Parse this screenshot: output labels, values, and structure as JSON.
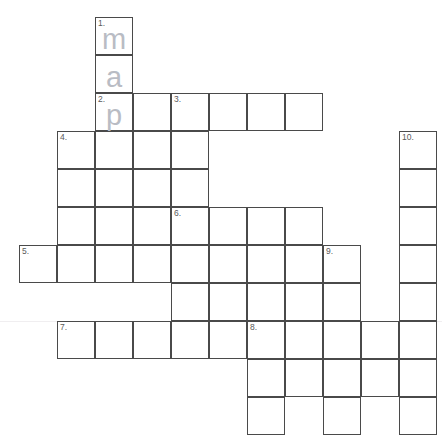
{
  "puzzle": {
    "title": "crossword-grid",
    "cell_size": 38,
    "origin_x": 19,
    "origin_y": 17,
    "border_color": "#4a4a4a",
    "cell_background": "#ffffff",
    "number_color": "#5a5a5a",
    "letter_color": "#b9bcc4",
    "page_background": "#ffffff",
    "rule_color": "#f0eef0",
    "rules_y": [
      321
    ],
    "cells": [
      {
        "col": 2,
        "row": 0,
        "number": "1.",
        "letter": "m"
      },
      {
        "col": 2,
        "row": 1,
        "number": "",
        "letter": "a"
      },
      {
        "col": 2,
        "row": 2,
        "number": "2.",
        "letter": "p"
      },
      {
        "col": 3,
        "row": 2,
        "number": "",
        "letter": ""
      },
      {
        "col": 4,
        "row": 2,
        "number": "3.",
        "letter": ""
      },
      {
        "col": 5,
        "row": 2,
        "number": "",
        "letter": ""
      },
      {
        "col": 6,
        "row": 2,
        "number": "",
        "letter": ""
      },
      {
        "col": 7,
        "row": 2,
        "number": "",
        "letter": ""
      },
      {
        "col": 1,
        "row": 3,
        "number": "4.",
        "letter": ""
      },
      {
        "col": 2,
        "row": 3,
        "number": "",
        "letter": ""
      },
      {
        "col": 3,
        "row": 3,
        "number": "",
        "letter": ""
      },
      {
        "col": 4,
        "row": 3,
        "number": "",
        "letter": ""
      },
      {
        "col": 1,
        "row": 4,
        "number": "",
        "letter": ""
      },
      {
        "col": 2,
        "row": 4,
        "number": "",
        "letter": ""
      },
      {
        "col": 3,
        "row": 4,
        "number": "",
        "letter": ""
      },
      {
        "col": 4,
        "row": 4,
        "number": "",
        "letter": ""
      },
      {
        "col": 1,
        "row": 5,
        "number": "",
        "letter": ""
      },
      {
        "col": 2,
        "row": 5,
        "number": "",
        "letter": ""
      },
      {
        "col": 3,
        "row": 5,
        "number": "",
        "letter": ""
      },
      {
        "col": 4,
        "row": 5,
        "number": "6.",
        "letter": ""
      },
      {
        "col": 5,
        "row": 5,
        "number": "",
        "letter": ""
      },
      {
        "col": 6,
        "row": 5,
        "number": "",
        "letter": ""
      },
      {
        "col": 7,
        "row": 5,
        "number": "",
        "letter": ""
      },
      {
        "col": 0,
        "row": 6,
        "number": "5.",
        "letter": ""
      },
      {
        "col": 1,
        "row": 6,
        "number": "",
        "letter": ""
      },
      {
        "col": 2,
        "row": 6,
        "number": "",
        "letter": ""
      },
      {
        "col": 3,
        "row": 6,
        "number": "",
        "letter": ""
      },
      {
        "col": 4,
        "row": 6,
        "number": "",
        "letter": ""
      },
      {
        "col": 5,
        "row": 6,
        "number": "",
        "letter": ""
      },
      {
        "col": 6,
        "row": 6,
        "number": "",
        "letter": ""
      },
      {
        "col": 7,
        "row": 6,
        "number": "",
        "letter": ""
      },
      {
        "col": 8,
        "row": 6,
        "number": "9.",
        "letter": ""
      },
      {
        "col": 4,
        "row": 7,
        "number": "",
        "letter": ""
      },
      {
        "col": 5,
        "row": 7,
        "number": "",
        "letter": ""
      },
      {
        "col": 6,
        "row": 7,
        "number": "",
        "letter": ""
      },
      {
        "col": 7,
        "row": 7,
        "number": "",
        "letter": ""
      },
      {
        "col": 8,
        "row": 7,
        "number": "",
        "letter": ""
      },
      {
        "col": 1,
        "row": 8,
        "number": "7.",
        "letter": ""
      },
      {
        "col": 2,
        "row": 8,
        "number": "",
        "letter": ""
      },
      {
        "col": 3,
        "row": 8,
        "number": "",
        "letter": ""
      },
      {
        "col": 4,
        "row": 8,
        "number": "",
        "letter": ""
      },
      {
        "col": 5,
        "row": 8,
        "number": "",
        "letter": ""
      },
      {
        "col": 6,
        "row": 8,
        "number": "8.",
        "letter": ""
      },
      {
        "col": 7,
        "row": 8,
        "number": "",
        "letter": ""
      },
      {
        "col": 8,
        "row": 8,
        "number": "",
        "letter": ""
      },
      {
        "col": 9,
        "row": 8,
        "number": "",
        "letter": ""
      },
      {
        "col": 10,
        "row": 8,
        "number": "",
        "letter": ""
      },
      {
        "col": 6,
        "row": 9,
        "number": "",
        "letter": ""
      },
      {
        "col": 7,
        "row": 9,
        "number": "",
        "letter": ""
      },
      {
        "col": 8,
        "row": 9,
        "number": "",
        "letter": ""
      },
      {
        "col": 9,
        "row": 9,
        "number": "",
        "letter": ""
      },
      {
        "col": 10,
        "row": 9,
        "number": "",
        "letter": ""
      },
      {
        "col": 6,
        "row": 10,
        "number": "",
        "letter": ""
      },
      {
        "col": 8,
        "row": 10,
        "number": "",
        "letter": ""
      },
      {
        "col": 10,
        "row": 10,
        "number": "",
        "letter": ""
      },
      {
        "col": 10,
        "row": 3,
        "number": "10.",
        "letter": ""
      },
      {
        "col": 10,
        "row": 4,
        "number": "",
        "letter": ""
      },
      {
        "col": 10,
        "row": 5,
        "number": "",
        "letter": ""
      },
      {
        "col": 10,
        "row": 6,
        "number": "",
        "letter": ""
      },
      {
        "col": 10,
        "row": 7,
        "number": "",
        "letter": ""
      }
    ]
  }
}
